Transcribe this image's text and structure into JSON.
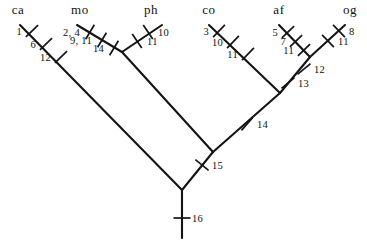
{
  "figure": {
    "type": "phylogenetic-cladogram",
    "orientation": "root-at-bottom",
    "background_color": "#ffffff",
    "line_color": "#141414"
  },
  "taxa": [
    {
      "id": "ca",
      "label": "ca",
      "x": 18,
      "y": 14
    },
    {
      "id": "mo",
      "label": "mo",
      "x": 80,
      "y": 14
    },
    {
      "id": "ph",
      "label": "ph",
      "x": 151,
      "y": 14
    },
    {
      "id": "co",
      "label": "co",
      "x": 209,
      "y": 14
    },
    {
      "id": "af",
      "label": "af",
      "x": 279,
      "y": 14
    },
    {
      "id": "og",
      "label": "og",
      "x": 350,
      "y": 14
    }
  ],
  "branches": [
    {
      "name": "branch-ca",
      "x1": 20,
      "y1": 25,
      "x2": 182,
      "y2": 190
    },
    {
      "name": "branch-mo",
      "x1": 77,
      "y1": 25,
      "x2": 122,
      "y2": 52
    },
    {
      "name": "branch-ph",
      "x1": 162,
      "y1": 25,
      "x2": 122,
      "y2": 52
    },
    {
      "name": "branch-mo-ph",
      "x1": 122,
      "y1": 52,
      "x2": 213,
      "y2": 152
    },
    {
      "name": "branch-node15",
      "x1": 213,
      "y1": 152,
      "x2": 182,
      "y2": 190
    },
    {
      "name": "branch-co",
      "x1": 209,
      "y1": 25,
      "x2": 280,
      "y2": 93
    },
    {
      "name": "branch-af",
      "x1": 279,
      "y1": 25,
      "x2": 310,
      "y2": 57
    },
    {
      "name": "branch-og",
      "x1": 345,
      "y1": 25,
      "x2": 310,
      "y2": 57
    },
    {
      "name": "branch-af-og",
      "x1": 310,
      "y1": 57,
      "x2": 280,
      "y2": 93
    },
    {
      "name": "branch-node14",
      "x1": 280,
      "y1": 93,
      "x2": 213,
      "y2": 152
    },
    {
      "name": "branch-root-stem",
      "x1": 182,
      "y1": 190,
      "x2": 182,
      "y2": 238
    }
  ],
  "character_marks": [
    {
      "label": "1",
      "cx": 32,
      "cy": 31,
      "angle": 45.5,
      "side": "left"
    },
    {
      "label": "6",
      "cx": 46,
      "cy": 44,
      "angle": 45.5,
      "side": "left"
    },
    {
      "label": "12",
      "cx": 61,
      "cy": 57,
      "angle": 45.5,
      "side": "left"
    },
    {
      "label": "2, 4",
      "cx": 90,
      "cy": 32,
      "angle": 31.0,
      "side": "left"
    },
    {
      "label": "9, 11",
      "cx": 102,
      "cy": 40,
      "angle": 31.0,
      "side": "left"
    },
    {
      "label": "14",
      "cx": 114,
      "cy": 48,
      "angle": 31.0,
      "side": "left"
    },
    {
      "label": "10",
      "cx": 148,
      "cy": 32,
      "angle": -34.0,
      "side": "right"
    },
    {
      "label": "11",
      "cx": 137,
      "cy": 41,
      "angle": -34.0,
      "side": "right"
    },
    {
      "label": "3",
      "cx": 219,
      "cy": 31,
      "angle": 44.0,
      "side": "left"
    },
    {
      "label": "10",
      "cx": 233,
      "cy": 42,
      "angle": 44.0,
      "side": "left"
    },
    {
      "label": "11",
      "cx": 248,
      "cy": 54,
      "angle": 44.0,
      "side": "left"
    },
    {
      "label": "5",
      "cx": 288,
      "cy": 32,
      "angle": 46.0,
      "side": "left"
    },
    {
      "label": "7",
      "cx": 296,
      "cy": 41,
      "angle": 46.0,
      "side": "left"
    },
    {
      "label": "11",
      "cx": 304,
      "cy": 50,
      "angle": 46.0,
      "side": "left"
    },
    {
      "label": "8",
      "cx": 339,
      "cy": 31,
      "angle": -44.0,
      "side": "right"
    },
    {
      "label": "11",
      "cx": 328,
      "cy": 41,
      "angle": -44.0,
      "side": "right"
    },
    {
      "label": "12",
      "cx": 304,
      "cy": 69,
      "angle": 50.0,
      "side": "right"
    },
    {
      "label": "13",
      "cx": 288,
      "cy": 83,
      "angle": 50.0,
      "side": "right"
    },
    {
      "label": "14",
      "cx": 247,
      "cy": 124,
      "angle": 41.0,
      "side": "right"
    },
    {
      "label": "15",
      "cx": 202,
      "cy": 165,
      "angle": -51.0,
      "side": "right"
    },
    {
      "label": "16",
      "cx": 182,
      "cy": 218,
      "angle": 90.0,
      "side": "right"
    }
  ]
}
